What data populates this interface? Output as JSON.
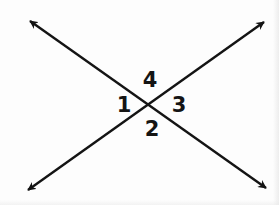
{
  "figure": {
    "kind": "geometry-diagram",
    "background_color": "#fdfdfd",
    "stroke_color": "#141414",
    "label_color": "#141414",
    "stroke_width": 2.4,
    "width": 279,
    "height": 205
  },
  "geometry": {
    "intersection": {
      "x": 153,
      "y": 106
    },
    "lines": [
      {
        "id": "line-a",
        "name": "line-upper-left-to-lower-right",
        "from": {
          "x": 30,
          "y": 21
        },
        "to": {
          "x": 266,
          "y": 188
        },
        "arrow_start": true,
        "arrow_end": true
      },
      {
        "id": "line-b",
        "name": "line-lower-left-to-upper-right",
        "from": {
          "x": 28,
          "y": 190
        },
        "to": {
          "x": 264,
          "y": 22
        },
        "arrow_start": true,
        "arrow_end": true
      }
    ],
    "arrowheads": [
      {
        "id": "arrow-top-left",
        "tip": {
          "x": 30,
          "y": 21
        }
      },
      {
        "id": "arrow-top-right",
        "tip": {
          "x": 264,
          "y": 22
        }
      },
      {
        "id": "arrow-bottom-left",
        "tip": {
          "x": 28,
          "y": 190
        }
      },
      {
        "id": "arrow-bottom-right",
        "tip": {
          "x": 266,
          "y": 188
        }
      }
    ]
  },
  "angle_labels": [
    {
      "id": "angle-4",
      "text": "4",
      "x": 150,
      "y": 80,
      "position": "top"
    },
    {
      "id": "angle-1",
      "text": "1",
      "x": 124,
      "y": 105,
      "position": "left"
    },
    {
      "id": "angle-3",
      "text": "3",
      "x": 179,
      "y": 105,
      "position": "right"
    },
    {
      "id": "angle-2",
      "text": "2",
      "x": 152,
      "y": 129,
      "position": "bottom"
    }
  ]
}
